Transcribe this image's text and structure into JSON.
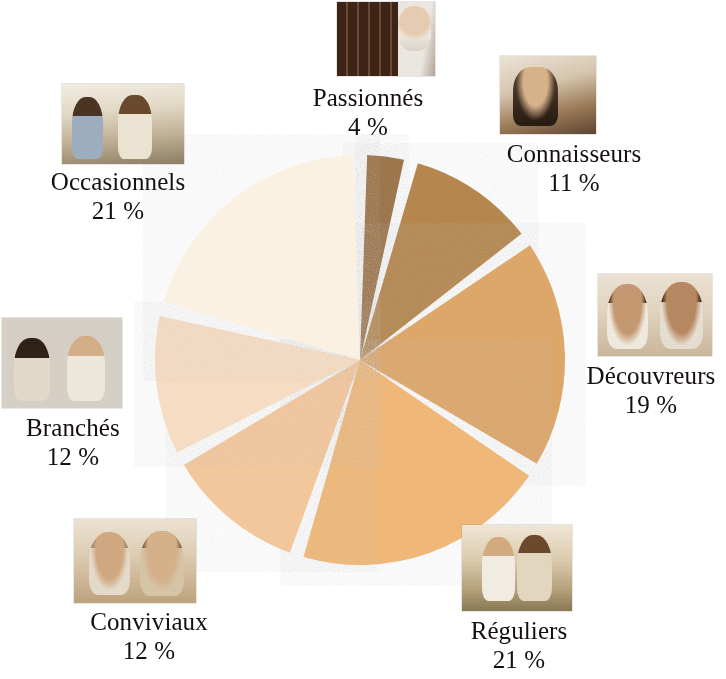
{
  "chart_data": {
    "type": "pie",
    "title": "",
    "subtitle": "",
    "xlabel": "",
    "ylabel": "",
    "legend_position": "around-slices",
    "grid": false,
    "unit": "%",
    "center": {
      "x": 360,
      "y": 360
    },
    "radius": 205,
    "gap_degrees": 4,
    "start_angle_degrees": -90,
    "direction": "clockwise",
    "categories": [
      "Passionnés",
      "Connaisseurs",
      "Découvreurs",
      "Réguliers",
      "Conviviaux",
      "Branchés",
      "Occasionnels"
    ],
    "values": [
      4,
      11,
      19,
      21,
      12,
      12,
      21
    ],
    "labels": [
      "4 %",
      "11 %",
      "19 %",
      "21 %",
      "12 %",
      "12 %",
      "21 %"
    ],
    "colors": [
      "#9a7042",
      "#b5874f",
      "#dda76a",
      "#f0b878",
      "#f3c79c",
      "#f6dcc3",
      "#faf1e2"
    ]
  },
  "background_color": "#ffffff",
  "text_color": "#15100d",
  "separator_color": "#ffffff",
  "slices": [
    {
      "name": "Passionnés",
      "label": "Passionnés",
      "percent_label": "4 %",
      "value": 4,
      "color": "#9a7042",
      "photo_name": "wine-cellar-photo"
    },
    {
      "name": "Connaisseurs",
      "label": "Connaisseurs",
      "percent_label": "11 %",
      "value": 11,
      "color": "#b5874f",
      "photo_name": "man-tasting-wine-photo"
    },
    {
      "name": "Découvreurs",
      "label": "Découvreurs",
      "percent_label": "19 %",
      "value": 19,
      "color": "#dda76a",
      "photo_name": "couple-toasting-red-wine-photo"
    },
    {
      "name": "Réguliers",
      "label": "Réguliers",
      "percent_label": "21 %",
      "value": 21,
      "color": "#f0b878",
      "photo_name": "couple-outdoor-meal-photo"
    },
    {
      "name": "Conviviaux",
      "label": "Conviviaux",
      "percent_label": "12 %",
      "value": 12,
      "color": "#f3c79c",
      "photo_name": "older-couple-toasting-photo"
    },
    {
      "name": "Branchés",
      "label": "Branchés",
      "percent_label": "12 %",
      "value": 12,
      "color": "#f6dcc3",
      "photo_name": "friends-at-bar-photo"
    },
    {
      "name": "Occasionnels",
      "label": "Occasionnels",
      "percent_label": "21 %",
      "value": 21,
      "color": "#faf1e2",
      "photo_name": "group-dinner-party-photo"
    }
  ]
}
